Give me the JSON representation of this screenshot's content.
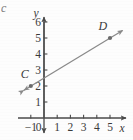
{
  "figure": {
    "corner_mark": "c",
    "axis_color": "#4a4a4a",
    "line_color": "#8a8a8a",
    "point_color": "#6b6b6b",
    "text_color": "#3a3a3a",
    "background": "#fdfdfd"
  },
  "chart_data": {
    "type": "line",
    "title": "",
    "subtitle": "",
    "xlabel": "x",
    "ylabel": "y",
    "grid": false,
    "legend": "none",
    "xlim": [
      -1.6,
      6.0
    ],
    "ylim": [
      -0.9,
      6.6
    ],
    "x_ticks": [
      -1,
      0,
      1,
      2,
      3,
      4,
      5
    ],
    "x_tick_labels": [
      "−1",
      "0",
      "1",
      "2",
      "3",
      "4",
      "5"
    ],
    "y_ticks": [
      0,
      1,
      2,
      3,
      4,
      5,
      6
    ],
    "y_tick_labels": [
      "0",
      "1",
      "2",
      "3",
      "4",
      "5",
      "6"
    ],
    "series": [
      {
        "name": "line CD",
        "kind": "line-through-points",
        "arrows": "both",
        "slope": 0.5,
        "y_intercept": 2.5,
        "equation": "y = 0.5x + 2.5",
        "x": [
          -1,
          5
        ],
        "values": [
          2,
          5
        ],
        "draw_from": [
          -1.55,
          1.72
        ],
        "draw_to": [
          5.95,
          5.47
        ]
      }
    ],
    "points": [
      {
        "label": "C",
        "x": -1,
        "y": 2,
        "label_dx": -0.45,
        "label_dy": 0.72
      },
      {
        "label": "D",
        "x": 5,
        "y": 5,
        "label_dx": -0.55,
        "label_dy": 0.78
      }
    ],
    "annotations": []
  }
}
